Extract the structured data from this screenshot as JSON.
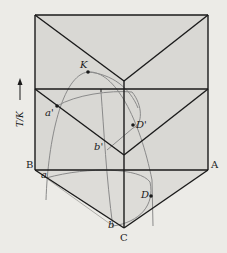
{
  "diagram": {
    "type": "ternary-phase-prism",
    "axis_label": "T/K",
    "vertices": {
      "A": "A",
      "B": "B",
      "C": "C"
    },
    "points": {
      "K": "K",
      "a_prime": "a'",
      "b_prime": "b'",
      "D_prime": "D'",
      "a": "a",
      "b": "b",
      "D": "D"
    },
    "colors": {
      "background": "#ecebe7",
      "face_shade": "#d9d8d4",
      "edge": "#1a1a1a",
      "curve": "#8a8a8a"
    }
  }
}
